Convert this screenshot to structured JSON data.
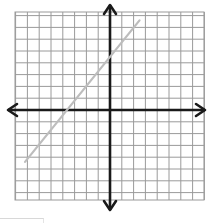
{
  "chart_data": {
    "type": "line",
    "title": "",
    "xlabel": "",
    "ylabel": "",
    "xlim": [
      -8,
      8
    ],
    "ylim": [
      -8,
      8
    ],
    "grid": true,
    "grid_step": 1,
    "axes": {
      "x_axis_arrows": true,
      "y_axis_arrows": true
    },
    "legend": null,
    "series": [
      {
        "name": "line",
        "color": "#bdbdbd",
        "points": [
          {
            "x": -7.2,
            "y": -4.4
          },
          {
            "x": 2.5,
            "y": 7.6
          }
        ],
        "approx_slope": 1.25,
        "approx_y_intercept": 4.5,
        "approx_x_intercept": -3.6
      }
    ]
  },
  "colors": {
    "grid": "#9a9a9a",
    "axis": "#1a1a1a",
    "line": "#bdbdbd",
    "background": "#ffffff"
  },
  "layout": {
    "origin_px": [
      110,
      110
    ],
    "cell_px": 11.8,
    "grid_left": 15,
    "grid_top": 12,
    "grid_right": 204,
    "grid_bottom": 200
  }
}
